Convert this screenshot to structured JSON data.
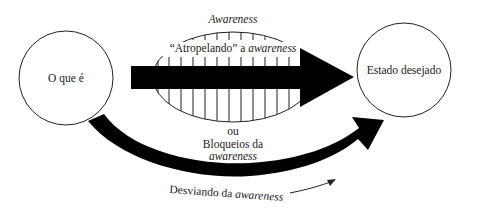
{
  "diagram": {
    "nodes": {
      "start": {
        "label": "O que é"
      },
      "end": {
        "label": "Estado desejado"
      }
    },
    "awareness_zone": {
      "title": "Awareness"
    },
    "paths": {
      "direct": {
        "prefix": "“Atropelando” a",
        "emph": "awareness"
      },
      "alternative": {
        "connector": "ou",
        "line1": "Bloqueios da",
        "line2": "awareness"
      },
      "deflection": {
        "prefix": "Desviando da",
        "emph": "awareness"
      }
    },
    "colors": {
      "ink": "#000000",
      "background": "#ffffff",
      "outline": "#333333"
    }
  }
}
